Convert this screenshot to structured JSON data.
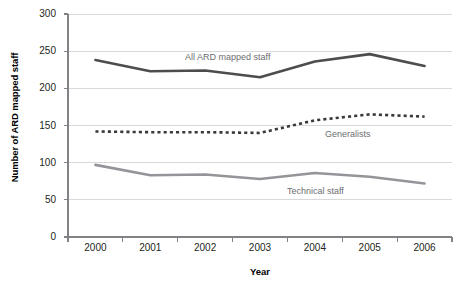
{
  "chart_data": {
    "type": "line",
    "title": "",
    "xlabel": "Year",
    "ylabel": "Number of ARD mapped staff",
    "categories": [
      "2000",
      "2001",
      "2002",
      "2003",
      "2004",
      "2005",
      "2006"
    ],
    "x": [
      2000,
      2001,
      2002,
      2003,
      2004,
      2005,
      2006
    ],
    "ylim": [
      0,
      300
    ],
    "yticks": [
      0,
      50,
      100,
      150,
      200,
      250,
      300
    ],
    "ytick_labels": [
      "0",
      "50",
      "100",
      "150",
      "200",
      "250",
      "300"
    ],
    "grid": "horizontal",
    "legend": "inline-labels",
    "series": [
      {
        "name": "All ARD mapped staff",
        "values": [
          238,
          223,
          224,
          215,
          236,
          246,
          230
        ],
        "color": "#4d4d4d",
        "style": "solid",
        "width": 2.6,
        "label_x": 185,
        "label_y": 52
      },
      {
        "name": "Generalists",
        "values": [
          142,
          141,
          141,
          140,
          157,
          165,
          162
        ],
        "color": "#3a3a3a",
        "style": "dotted",
        "width": 2.6,
        "label_x": 325,
        "label_y": 129
      },
      {
        "name": "Technical staff",
        "values": [
          97,
          83,
          84,
          78,
          86,
          81,
          72
        ],
        "color": "#939598",
        "style": "solid",
        "width": 2.6,
        "label_x": 287,
        "label_y": 186
      }
    ],
    "axis_color": "#808285",
    "grid_color": "#d9d9d9",
    "plot_left": 68,
    "plot_right": 452,
    "plot_top": 14,
    "plot_bottom": 237
  }
}
